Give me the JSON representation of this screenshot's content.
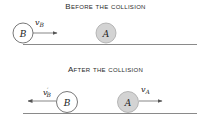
{
  "panels": [
    {
      "title": "Before the collision",
      "balls": [
        {
          "label": "B",
          "cx": 23,
          "cy": 33,
          "r": 10,
          "fill": "#ffffff"
        },
        {
          "label": "A",
          "cx": 106,
          "cy": 33,
          "r": 10,
          "fill": "#d3d3d3"
        }
      ],
      "ground": {
        "x1": 23,
        "x2": 197,
        "y": 45
      },
      "arrows": [
        {
          "label": "v",
          "sub": "B",
          "prime": false,
          "x1": 33,
          "x2": 57,
          "y": 33,
          "dir": "right",
          "label_x": 35,
          "label_y": 25
        }
      ]
    },
    {
      "title": "After the collision",
      "balls": [
        {
          "label": "B",
          "cx": 67,
          "cy": 102,
          "r": 10.5,
          "fill": "#ffffff"
        },
        {
          "label": "A",
          "cx": 128,
          "cy": 102,
          "r": 10.5,
          "fill": "#d3d3d3"
        }
      ],
      "ground": {
        "x1": 23,
        "x2": 197,
        "y": 113.5
      },
      "arrows": [
        {
          "label": "v",
          "sub": "B",
          "prime": true,
          "x1": 56,
          "x2": 28,
          "y": 101,
          "dir": "left",
          "label_x": 43,
          "label_y": 95
        },
        {
          "label": "v",
          "sub": "A",
          "prime": false,
          "x1": 139,
          "x2": 162,
          "y": 101,
          "dir": "right",
          "label_x": 140,
          "label_y": 92
        }
      ]
    }
  ],
  "colors": {
    "stroke": "#555555",
    "ground": "#8a8a8a",
    "ball_gray": "#d3d3d3",
    "text": "#222222"
  }
}
